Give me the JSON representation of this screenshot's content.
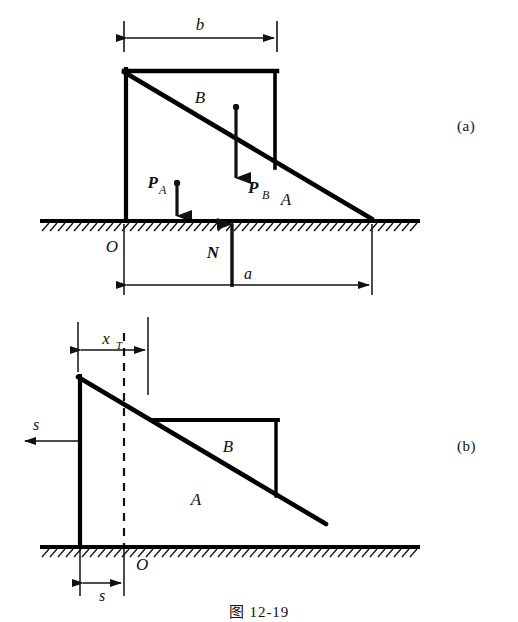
{
  "figure": {
    "caption": "图 12-19",
    "panels": [
      {
        "id": "a",
        "label": "(a)"
      },
      {
        "id": "b",
        "label": "(b)"
      }
    ]
  },
  "panel_a": {
    "dimension_b": "b",
    "dimension_a": "a",
    "origin_label": "O",
    "region_upper": "B",
    "region_lower": "A",
    "force_pa": "P",
    "force_pa_sub": "A",
    "force_pb": "P",
    "force_pb_sub": "B",
    "force_n": "N"
  },
  "panel_b": {
    "dimension_xt": "x",
    "dimension_xt_sub": "T",
    "displacement_s_left": "s",
    "displacement_s_bottom": "s",
    "origin_label": "O",
    "region_upper": "B",
    "region_lower": "A"
  },
  "colors": {
    "ink": "#111111",
    "line": "#000000",
    "background": "#ffffff"
  }
}
